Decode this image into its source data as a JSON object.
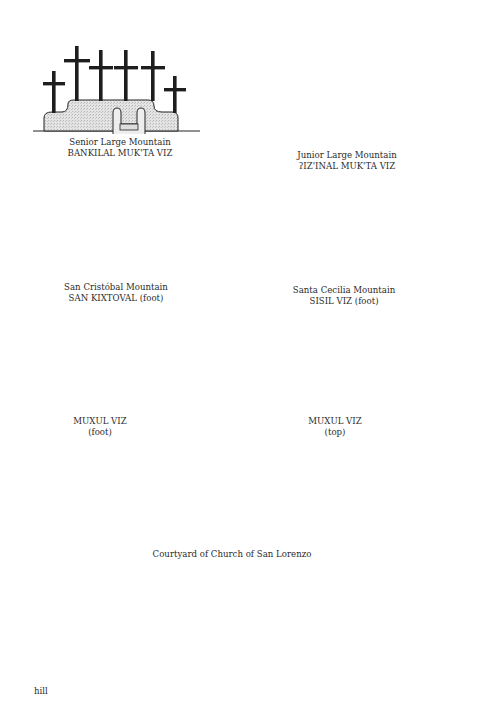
{
  "figure": {
    "panels": [
      {
        "id": "senior-large-mountain",
        "line1": "Senior Large Mountain",
        "line2": "BANKILAL MUK'TA VIZ",
        "crosses": 6
      },
      {
        "id": "junior-large-mountain",
        "line1": "Junior Large Mountain",
        "line2": "ʔIZ'INAL MUK'TA VIZ",
        "crosses": 1
      },
      {
        "id": "san-cristobal-mountain",
        "line1": "San Cristóbal Mountain",
        "line2": "SAN KIXTOVAL (foot)",
        "crosses": 6
      },
      {
        "id": "santa-cecilia-mountain",
        "line1": "Santa Cecilia Mountain",
        "line2": "SISIL VIZ (foot)",
        "crosses": 3
      },
      {
        "id": "muxul-viz-foot",
        "line1": "MUXUL VIZ",
        "line2": "(foot)",
        "crosses": 2
      },
      {
        "id": "muxul-viz-top",
        "line1": "MUXUL VIZ",
        "line2": "(top)",
        "crosses": 5
      },
      {
        "id": "church-courtyard",
        "line1": "Courtyard of Church of San Lorenzo",
        "line2": "",
        "crosses": 3
      }
    ],
    "bottom": {
      "hill_label": "hill",
      "crosses": 6
    },
    "colors": {
      "ink": "#1e1e1e",
      "stipple": "#dcdcdc",
      "hill": "#a8a8a8"
    }
  }
}
